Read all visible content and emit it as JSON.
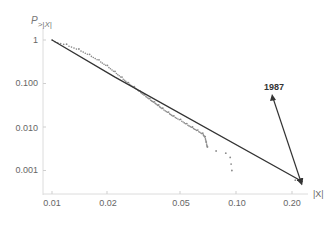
{
  "chart_data": {
    "type": "scatter",
    "title": "",
    "xlabel": "|X|",
    "ylabel": "P>|X|",
    "x_scale": "log",
    "y_scale": "log",
    "xlim": [
      0.009,
      0.23
    ],
    "ylim": [
      0.0007,
      1.3
    ],
    "x_ticks": [
      0.01,
      0.02,
      0.05,
      0.1,
      0.2
    ],
    "x_tick_labels": [
      "0.01",
      "0.02",
      "0.05",
      "0.10",
      "0.20"
    ],
    "y_ticks": [
      1,
      0.1,
      0.01,
      0.001
    ],
    "y_tick_labels": [
      "1",
      "0.100",
      "0.010",
      "0.001"
    ],
    "grid": false,
    "series": [
      {
        "name": "empirical tail",
        "kind": "points",
        "points": [
          [
            0.01,
            1.0
          ],
          [
            0.012,
            0.8
          ],
          [
            0.014,
            0.62
          ],
          [
            0.016,
            0.47
          ],
          [
            0.018,
            0.35
          ],
          [
            0.02,
            0.26
          ],
          [
            0.022,
            0.19
          ],
          [
            0.024,
            0.14
          ],
          [
            0.026,
            0.105
          ],
          [
            0.028,
            0.085
          ],
          [
            0.03,
            0.068
          ],
          [
            0.032,
            0.055
          ],
          [
            0.034,
            0.045
          ],
          [
            0.036,
            0.038
          ],
          [
            0.038,
            0.032
          ],
          [
            0.04,
            0.027
          ],
          [
            0.043,
            0.022
          ],
          [
            0.046,
            0.018
          ],
          [
            0.05,
            0.015
          ],
          [
            0.054,
            0.012
          ],
          [
            0.058,
            0.01
          ],
          [
            0.062,
            0.0085
          ],
          [
            0.066,
            0.0072
          ],
          [
            0.068,
            0.006
          ],
          [
            0.069,
            0.0045
          ],
          [
            0.07,
            0.0035
          ],
          [
            0.078,
            0.0028
          ],
          [
            0.088,
            0.0025
          ],
          [
            0.093,
            0.002
          ],
          [
            0.094,
            0.0014
          ],
          [
            0.095,
            0.001
          ],
          [
            0.21,
            0.0006
          ]
        ]
      },
      {
        "name": "power-law fit",
        "kind": "line",
        "points": [
          [
            0.01,
            1.0
          ],
          [
            0.022,
            0.14
          ],
          [
            0.23,
            0.00055
          ]
        ]
      }
    ],
    "annotations": [
      {
        "text": "1987",
        "arrow_to": [
          0.21,
          0.0006
        ]
      }
    ]
  },
  "labels": {
    "y_axis_title": "P",
    "y_axis_sub": ">|X|",
    "x_axis_title": "|X|",
    "annotation": "1987",
    "x_ticks": [
      "0.01",
      "0.02",
      "0.05",
      "0.10",
      "0.20"
    ],
    "y_ticks": [
      "1",
      "0.100",
      "0.010",
      "0.001"
    ]
  },
  "colors": {
    "axis": "#d8d8d8",
    "line": "#333333",
    "points": "#888888",
    "arrow": "#333333"
  }
}
